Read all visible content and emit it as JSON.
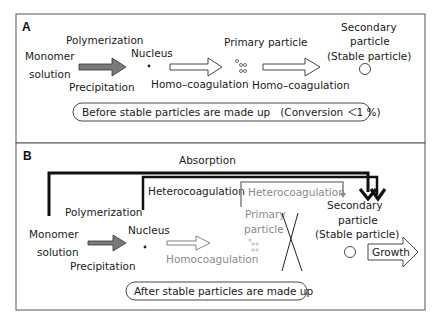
{
  "panel_a": {
    "letter": "A",
    "monomer_line1": "Monomer",
    "monomer_line2": "solution",
    "polymerization": "Polymerization",
    "precipitation": "Precipitation",
    "nucleus": "Nucleus",
    "homo1": "Homo–coagulation",
    "primary": "Primary particle",
    "homo2": "Homo–coagulation",
    "secondary_line1": "Secondary",
    "secondary_line2": "particle",
    "secondary_line3": "(Stable particle)",
    "caption": "Before stable particles are made up　(Conversion ＜1 %)"
  },
  "panel_b": {
    "letter": "B",
    "absorption": "Absorption",
    "heterocoag_dark": "Heterocoagulation",
    "heterocoag_gray": "Heterocoagulation",
    "polymerization": "Polymerization",
    "monomer_line1": "Monomer",
    "monomer_line2": "solution",
    "precipitation": "Precipitation",
    "nucleus": "Nucleus",
    "homocoag": "Homocoagulation",
    "primary_line1": "Primary",
    "primary_line2": "particle",
    "secondary_line1": "Secondary",
    "secondary_line2": "particle",
    "secondary_line3": "(Stable particle)",
    "growth": "Growth",
    "caption": "After stable particles are made up"
  },
  "colors": {
    "dark": "#1a1a1a",
    "gray_text": "#8a8a8a",
    "arrow_fill": "#7a7a7a"
  }
}
